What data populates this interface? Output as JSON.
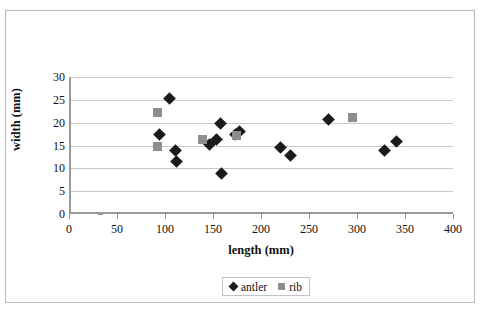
{
  "chart_data": {
    "type": "scatter",
    "title": "",
    "xlabel": "length (mm)",
    "ylabel": "width (mm)",
    "xlim": [
      0,
      400
    ],
    "ylim": [
      0,
      30
    ],
    "xticks": [
      0,
      50,
      100,
      150,
      200,
      250,
      300,
      350,
      400
    ],
    "yticks": [
      0,
      5,
      10,
      15,
      20,
      25,
      30
    ],
    "grid": "horizontal",
    "legend_position": "bottom-center",
    "series": [
      {
        "name": "antler",
        "marker": "diamond",
        "color": "#1b1b1b",
        "points": [
          [
            103,
            25.3
          ],
          [
            92,
            17.5
          ],
          [
            109,
            13.8
          ],
          [
            110,
            11.6
          ],
          [
            144,
            15.3
          ],
          [
            152,
            16.3
          ],
          [
            156,
            19.8
          ],
          [
            157,
            8.9
          ],
          [
            171,
            17.3
          ],
          [
            176,
            18.0
          ],
          [
            218,
            14.5
          ],
          [
            229,
            12.8
          ],
          [
            268,
            20.6
          ],
          [
            327,
            13.9
          ],
          [
            339,
            15.8
          ]
        ]
      },
      {
        "name": "rib",
        "marker": "square",
        "color": "#8e8e8e",
        "points": [
          [
            90,
            22.3
          ],
          [
            90,
            14.7
          ],
          [
            137,
            16.3
          ],
          [
            172,
            17.2
          ],
          [
            293,
            21.2
          ]
        ]
      }
    ]
  },
  "legend": {
    "entries": [
      {
        "label": "antler"
      },
      {
        "label": "rib"
      }
    ]
  },
  "axes": {
    "x_title": "length (mm)",
    "y_title": "width (mm)"
  },
  "colors": {
    "antler": "#1b1b1b",
    "rib": "#8e8e8e",
    "gridline": "#c9c9c9",
    "axis": "#9a9a9a",
    "frame": "#b9b9b9"
  }
}
